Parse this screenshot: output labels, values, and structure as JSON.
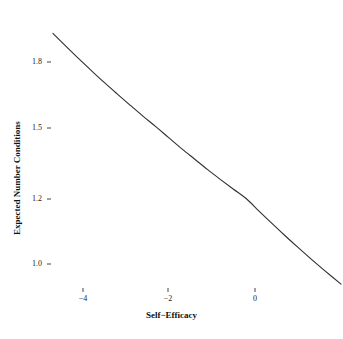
{
  "chart_data": {
    "type": "line",
    "title": "",
    "xlabel": "Self−Efficacy",
    "ylabel": "Expected Number Conditions",
    "xlim": [
      -5.0,
      2.05
    ],
    "ylim": [
      0.92,
      1.96
    ],
    "grid": false,
    "legend": null,
    "xticks": [
      -4,
      -2,
      0
    ],
    "xticklabels": [
      "−4",
      "−2",
      "0"
    ],
    "yticks": [
      1.0,
      1.2,
      1.5,
      1.8
    ],
    "yticklabels": [
      "1.0",
      "1.2",
      "1.5",
      "1.8"
    ],
    "series": [
      {
        "name": "Expected Number Conditions",
        "color": "#303030",
        "linewidth": 1.1,
        "x": [
          -4.7,
          -4.4,
          -4.1,
          -3.8,
          -3.5,
          -3.2,
          -2.9,
          -2.6,
          -2.3,
          -2.0,
          -1.7,
          -1.4,
          -1.1,
          -0.8,
          -0.5,
          -0.2,
          0.1,
          0.4,
          0.7,
          1.0,
          1.3,
          1.6,
          2.0
        ],
        "y": [
          1.93,
          1.872,
          1.815,
          1.76,
          1.706,
          1.654,
          1.603,
          1.553,
          1.505,
          1.458,
          1.412,
          1.368,
          1.324,
          1.282,
          1.241,
          1.201,
          1.162,
          1.124,
          1.087,
          1.051,
          1.016,
          0.982,
          0.938
        ]
      }
    ]
  },
  "axes": {
    "x_title": "Self−Efficacy",
    "y_title": "Expected Number Conditions",
    "x_tick_labels": [
      "−4",
      "−2",
      "0"
    ],
    "y_tick_labels": [
      "1.8",
      "1.5",
      "1.2",
      "1.0"
    ]
  },
  "style": {
    "line_color": "#303030",
    "text_color": "#222222",
    "background": "#ffffff"
  }
}
